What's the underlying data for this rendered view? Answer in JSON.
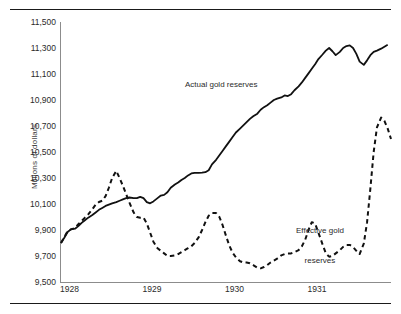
{
  "figure": {
    "ylabel": "Millions of dollars",
    "label_actual": "Actual gold reserves",
    "label_effective_line1": "Effective gold",
    "label_effective_line2": "reserves"
  },
  "chart_data": {
    "type": "line",
    "title": "",
    "xlabel": "",
    "ylabel": "Millions of dollars",
    "xlim": [
      1928.0,
      1932.0
    ],
    "ylim": [
      9500,
      11500
    ],
    "yticks": [
      "9,500",
      "9,700",
      "9,900",
      "10,100",
      "10,300",
      "10,500",
      "10,700",
      "10,900",
      "11,100",
      "11,300",
      "11,500"
    ],
    "ytick_values": [
      9500,
      9700,
      9900,
      10100,
      10300,
      10500,
      10700,
      10900,
      11100,
      11300,
      11500
    ],
    "xticks": [
      "1928",
      "1929",
      "1930",
      "1931"
    ],
    "xtick_values": [
      1928,
      1929,
      1930,
      1931
    ],
    "grid": false,
    "legend": "inline-annotations",
    "annotations": [
      {
        "text": "Actual gold reserves",
        "x": 1929.6,
        "y": 10960
      },
      {
        "text": "Effective gold reserves",
        "x": 1931.05,
        "y": 10000
      }
    ],
    "series": [
      {
        "name": "Actual gold reserves",
        "style": "solid",
        "color": "#111111",
        "points": [
          [
            1928.0,
            9800
          ],
          [
            1928.04,
            9840
          ],
          [
            1928.08,
            9885
          ],
          [
            1928.12,
            9905
          ],
          [
            1928.17,
            9910
          ],
          [
            1928.21,
            9930
          ],
          [
            1928.25,
            9955
          ],
          [
            1928.29,
            9975
          ],
          [
            1928.33,
            9995
          ],
          [
            1928.38,
            10015
          ],
          [
            1928.42,
            10035
          ],
          [
            1928.46,
            10055
          ],
          [
            1928.5,
            10070
          ],
          [
            1928.54,
            10085
          ],
          [
            1928.58,
            10095
          ],
          [
            1928.62,
            10105
          ],
          [
            1928.67,
            10115
          ],
          [
            1928.71,
            10125
          ],
          [
            1928.75,
            10135
          ],
          [
            1928.79,
            10145
          ],
          [
            1928.83,
            10150
          ],
          [
            1928.88,
            10145
          ],
          [
            1928.92,
            10145
          ],
          [
            1928.96,
            10155
          ],
          [
            1929.0,
            10145
          ],
          [
            1929.04,
            10115
          ],
          [
            1929.08,
            10105
          ],
          [
            1929.12,
            10120
          ],
          [
            1929.17,
            10145
          ],
          [
            1929.21,
            10165
          ],
          [
            1929.25,
            10170
          ],
          [
            1929.29,
            10190
          ],
          [
            1929.33,
            10225
          ],
          [
            1929.38,
            10250
          ],
          [
            1929.42,
            10265
          ],
          [
            1929.46,
            10285
          ],
          [
            1929.5,
            10300
          ],
          [
            1929.54,
            10320
          ],
          [
            1929.58,
            10335
          ],
          [
            1929.62,
            10340
          ],
          [
            1929.67,
            10340
          ],
          [
            1929.71,
            10342
          ],
          [
            1929.75,
            10345
          ],
          [
            1929.79,
            10360
          ],
          [
            1929.83,
            10405
          ],
          [
            1929.88,
            10440
          ],
          [
            1929.92,
            10475
          ],
          [
            1929.96,
            10510
          ],
          [
            1930.0,
            10545
          ],
          [
            1930.04,
            10580
          ],
          [
            1930.08,
            10615
          ],
          [
            1930.12,
            10650
          ],
          [
            1930.17,
            10680
          ],
          [
            1930.21,
            10705
          ],
          [
            1930.25,
            10730
          ],
          [
            1930.29,
            10755
          ],
          [
            1930.33,
            10775
          ],
          [
            1930.38,
            10795
          ],
          [
            1930.42,
            10825
          ],
          [
            1930.46,
            10845
          ],
          [
            1930.5,
            10860
          ],
          [
            1930.54,
            10880
          ],
          [
            1930.58,
            10900
          ],
          [
            1930.62,
            10910
          ],
          [
            1930.67,
            10920
          ],
          [
            1930.71,
            10935
          ],
          [
            1930.75,
            10930
          ],
          [
            1930.79,
            10945
          ],
          [
            1930.83,
            10975
          ],
          [
            1930.88,
            11005
          ],
          [
            1930.92,
            11035
          ],
          [
            1930.96,
            11070
          ],
          [
            1931.0,
            11105
          ],
          [
            1931.04,
            11140
          ],
          [
            1931.08,
            11175
          ],
          [
            1931.12,
            11215
          ],
          [
            1931.17,
            11250
          ],
          [
            1931.21,
            11280
          ],
          [
            1931.25,
            11300
          ],
          [
            1931.29,
            11275
          ],
          [
            1931.33,
            11245
          ],
          [
            1931.38,
            11270
          ],
          [
            1931.42,
            11300
          ],
          [
            1931.46,
            11315
          ],
          [
            1931.5,
            11320
          ],
          [
            1931.54,
            11300
          ],
          [
            1931.58,
            11255
          ],
          [
            1931.62,
            11195
          ],
          [
            1931.67,
            11170
          ],
          [
            1931.71,
            11205
          ],
          [
            1931.75,
            11245
          ],
          [
            1931.79,
            11270
          ],
          [
            1931.83,
            11280
          ],
          [
            1931.88,
            11295
          ],
          [
            1931.92,
            11310
          ],
          [
            1931.96,
            11325
          ]
        ]
      },
      {
        "name": "Effective gold reserves",
        "style": "dashed",
        "color": "#111111",
        "points": [
          [
            1928.0,
            9800
          ],
          [
            1928.04,
            9845
          ],
          [
            1928.08,
            9890
          ],
          [
            1928.12,
            9905
          ],
          [
            1928.17,
            9915
          ],
          [
            1928.21,
            9945
          ],
          [
            1928.25,
            9970
          ],
          [
            1928.29,
            9995
          ],
          [
            1928.33,
            10020
          ],
          [
            1928.38,
            10060
          ],
          [
            1928.42,
            10095
          ],
          [
            1928.46,
            10115
          ],
          [
            1928.5,
            10125
          ],
          [
            1928.54,
            10160
          ],
          [
            1928.58,
            10225
          ],
          [
            1928.62,
            10300
          ],
          [
            1928.67,
            10355
          ],
          [
            1928.71,
            10300
          ],
          [
            1928.75,
            10240
          ],
          [
            1928.79,
            10175
          ],
          [
            1928.83,
            10110
          ],
          [
            1928.88,
            10035
          ],
          [
            1928.92,
            10000
          ],
          [
            1928.96,
            9995
          ],
          [
            1929.0,
            9995
          ],
          [
            1929.04,
            9950
          ],
          [
            1929.08,
            9880
          ],
          [
            1929.12,
            9810
          ],
          [
            1929.17,
            9760
          ],
          [
            1929.21,
            9740
          ],
          [
            1929.25,
            9720
          ],
          [
            1929.29,
            9700
          ],
          [
            1929.33,
            9700
          ],
          [
            1929.38,
            9705
          ],
          [
            1929.42,
            9715
          ],
          [
            1929.46,
            9730
          ],
          [
            1929.5,
            9745
          ],
          [
            1929.54,
            9760
          ],
          [
            1929.58,
            9775
          ],
          [
            1929.62,
            9800
          ],
          [
            1929.67,
            9845
          ],
          [
            1929.71,
            9900
          ],
          [
            1929.75,
            9960
          ],
          [
            1929.79,
            10010
          ],
          [
            1929.83,
            10030
          ],
          [
            1929.88,
            10030
          ],
          [
            1929.92,
            10000
          ],
          [
            1929.96,
            9935
          ],
          [
            1930.0,
            9855
          ],
          [
            1930.04,
            9780
          ],
          [
            1930.08,
            9725
          ],
          [
            1930.12,
            9690
          ],
          [
            1930.17,
            9660
          ],
          [
            1930.21,
            9650
          ],
          [
            1930.25,
            9650
          ],
          [
            1930.29,
            9645
          ],
          [
            1930.33,
            9630
          ],
          [
            1930.38,
            9610
          ],
          [
            1930.42,
            9605
          ],
          [
            1930.46,
            9615
          ],
          [
            1930.5,
            9630
          ],
          [
            1930.54,
            9650
          ],
          [
            1930.58,
            9665
          ],
          [
            1930.62,
            9680
          ],
          [
            1930.67,
            9705
          ],
          [
            1930.71,
            9715
          ],
          [
            1930.75,
            9720
          ],
          [
            1930.79,
            9720
          ],
          [
            1930.83,
            9730
          ],
          [
            1930.88,
            9745
          ],
          [
            1930.92,
            9775
          ],
          [
            1930.96,
            9825
          ],
          [
            1931.0,
            9900
          ],
          [
            1931.04,
            9960
          ],
          [
            1931.08,
            9950
          ],
          [
            1931.12,
            9880
          ],
          [
            1931.17,
            9790
          ],
          [
            1931.21,
            9720
          ],
          [
            1931.25,
            9695
          ],
          [
            1931.29,
            9700
          ],
          [
            1931.33,
            9720
          ],
          [
            1931.38,
            9745
          ],
          [
            1931.42,
            9770
          ],
          [
            1931.46,
            9785
          ],
          [
            1931.5,
            9785
          ],
          [
            1931.54,
            9770
          ],
          [
            1931.58,
            9740
          ],
          [
            1931.62,
            9715
          ],
          [
            1931.67,
            9795
          ],
          [
            1931.71,
            9960
          ],
          [
            1931.75,
            10220
          ],
          [
            1931.79,
            10500
          ],
          [
            1931.83,
            10690
          ],
          [
            1931.88,
            10765
          ],
          [
            1931.92,
            10740
          ],
          [
            1931.96,
            10680
          ],
          [
            1932.0,
            10600
          ]
        ]
      }
    ]
  }
}
